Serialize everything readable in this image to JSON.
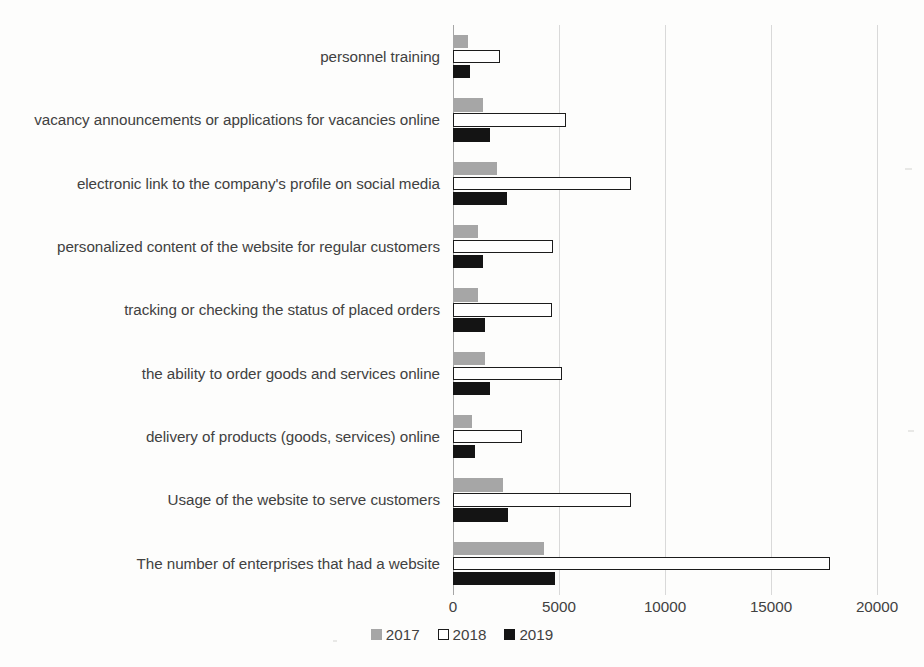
{
  "chart_data": {
    "type": "bar",
    "orientation": "horizontal",
    "title": "",
    "xlabel": "",
    "ylabel": "",
    "xlim": [
      0,
      20000
    ],
    "grid": true,
    "legend_position": "bottom",
    "tick_labels": [
      "0",
      "5000",
      "10000",
      "15000",
      "20000"
    ],
    "tick_values": [
      0,
      5000,
      10000,
      15000,
      20000
    ],
    "categories": [
      "personnel training",
      "vacancy announcements or applications for vacancies online",
      "electronic link to the company's profile on social media",
      "personalized content of the website for regular customers",
      "tracking or checking the status of placed orders",
      "the ability to order goods and services online",
      "delivery of products (goods, services) online",
      "Usage of the website to serve customers",
      "The number of enterprises that had a website"
    ],
    "series": [
      {
        "name": "2017",
        "color": "#a6a6a6",
        "values": [
          700,
          1400,
          2070,
          1170,
          1170,
          1500,
          890,
          2350,
          4270
        ]
      },
      {
        "name": "2018",
        "color": "#ffffff",
        "values": [
          2200,
          5350,
          8400,
          4700,
          4650,
          5160,
          3240,
          8400,
          17800
        ]
      },
      {
        "name": "2019",
        "color": "#141414",
        "values": [
          800,
          1740,
          2540,
          1400,
          1500,
          1740,
          1030,
          2580,
          4790
        ]
      }
    ]
  },
  "legend": {
    "items": [
      {
        "label": "2017",
        "swatch": "filled-gray-square-icon"
      },
      {
        "label": "2018",
        "swatch": "outlined-white-square-icon"
      },
      {
        "label": "2019",
        "swatch": "filled-black-square-icon"
      }
    ]
  }
}
